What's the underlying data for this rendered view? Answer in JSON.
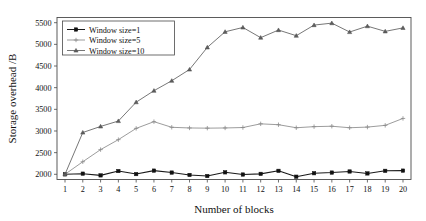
{
  "chart_data": {
    "type": "line",
    "title": "",
    "xlabel": "Number of blocks",
    "ylabel": "Storage overhead /B",
    "x": [
      1,
      2,
      3,
      4,
      5,
      6,
      7,
      8,
      9,
      10,
      11,
      12,
      13,
      14,
      15,
      16,
      17,
      18,
      19,
      20
    ],
    "xlim": [
      0.55,
      20.45
    ],
    "ylim": [
      1880,
      5620
    ],
    "yticks": [
      2000,
      2500,
      3000,
      3500,
      4000,
      4500,
      5000,
      5500
    ],
    "xticks": [
      1,
      2,
      3,
      4,
      5,
      6,
      7,
      8,
      9,
      10,
      11,
      12,
      13,
      14,
      15,
      16,
      17,
      18,
      19,
      20
    ],
    "grid": false,
    "legend_position": "upper left",
    "series": [
      {
        "name": "Window size=1",
        "marker": "square",
        "color": "#111111",
        "values": [
          2000,
          2015,
          1975,
          2075,
          2005,
          2085,
          2040,
          1985,
          1960,
          2045,
          1995,
          2010,
          2080,
          1945,
          2025,
          2040,
          2065,
          2020,
          2080,
          2085
        ]
      },
      {
        "name": "Window size=5",
        "marker": "plus",
        "color": "#8a8a8a",
        "values": [
          2000,
          2290,
          2570,
          2800,
          3060,
          3215,
          3085,
          3070,
          3065,
          3070,
          3080,
          3165,
          3145,
          3075,
          3100,
          3110,
          3075,
          3090,
          3130,
          3290
        ]
      },
      {
        "name": "Window size=10",
        "marker": "triangle",
        "color": "#5e5e5e",
        "values": [
          2000,
          2965,
          3105,
          3230,
          3665,
          3930,
          4160,
          4420,
          4930,
          5290,
          5390,
          5155,
          5330,
          5200,
          5445,
          5490,
          5285,
          5420,
          5300,
          5380
        ]
      }
    ]
  },
  "axes": {
    "ylabel": "Storage overhead /B",
    "xlabel": "Number of blocks",
    "ytick_labels": [
      "2000",
      "2500",
      "3000",
      "3500",
      "4000",
      "4500",
      "5000",
      "5500"
    ],
    "xtick_labels": [
      "1",
      "2",
      "3",
      "4",
      "5",
      "6",
      "7",
      "8",
      "9",
      "10",
      "11",
      "12",
      "13",
      "14",
      "15",
      "16",
      "17",
      "18",
      "19",
      "20"
    ]
  },
  "legend": {
    "entries": [
      {
        "label": "Window size=1",
        "marker": "square-marker"
      },
      {
        "label": "Window size=5",
        "marker": "plus-marker"
      },
      {
        "label": "Window size=10",
        "marker": "triangle-marker"
      }
    ]
  },
  "colors": {
    "series1": "#111111",
    "series2": "#8a8a8a",
    "series3": "#5e5e5e",
    "axis": "#4a4a4a",
    "background": "#ffffff"
  }
}
